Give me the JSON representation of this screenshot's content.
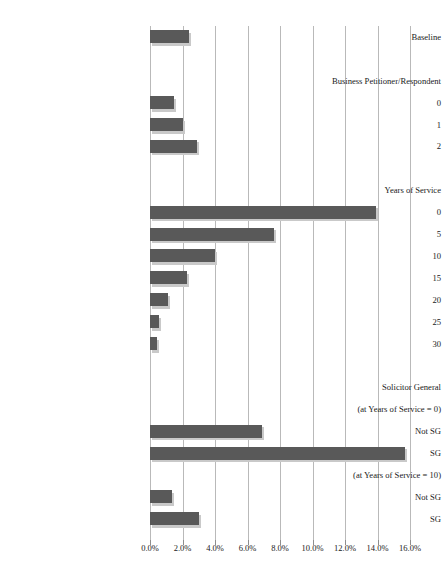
{
  "chart_data": {
    "type": "bar",
    "orientation": "horizontal",
    "title": "",
    "subtitle": "",
    "xlabel": "",
    "ylabel": "",
    "xlim": [
      0,
      16
    ],
    "xtick_labels": [
      "0.0%",
      "2.0%",
      "4.0%",
      "6.0%",
      "8.0%",
      "10.0%",
      "12.0%",
      "14.0%",
      "16.0%"
    ],
    "xtick_values": [
      0,
      2,
      4,
      6,
      8,
      10,
      12,
      14,
      16
    ],
    "grid": true,
    "legend": "none",
    "bar_color": "#595959",
    "gridline_color": "#b9b9b9",
    "rows": [
      {
        "label": "Baseline",
        "kind": "bar",
        "value": 2.4
      },
      {
        "label": "",
        "kind": "spacer",
        "value": null
      },
      {
        "label": "Business Petitioner/Respondent",
        "kind": "group",
        "value": null
      },
      {
        "label": "0",
        "kind": "bar",
        "value": 1.5
      },
      {
        "label": "1",
        "kind": "bar",
        "value": 2.0
      },
      {
        "label": "2",
        "kind": "bar",
        "value": 2.9
      },
      {
        "label": "",
        "kind": "spacer",
        "value": null
      },
      {
        "label": "Years of Service",
        "kind": "group",
        "value": null
      },
      {
        "label": "0",
        "kind": "bar",
        "value": 13.9
      },
      {
        "label": "5",
        "kind": "bar",
        "value": 7.6
      },
      {
        "label": "10",
        "kind": "bar",
        "value": 4.0
      },
      {
        "label": "15",
        "kind": "bar",
        "value": 2.3
      },
      {
        "label": "20",
        "kind": "bar",
        "value": 1.1
      },
      {
        "label": "25",
        "kind": "bar",
        "value": 0.55
      },
      {
        "label": "30",
        "kind": "bar",
        "value": 0.4
      },
      {
        "label": "",
        "kind": "spacer",
        "value": null
      },
      {
        "label": "Solicitor General",
        "kind": "group",
        "value": null
      },
      {
        "label": "(at Years of Service = 0)",
        "kind": "group",
        "value": null
      },
      {
        "label": "Not SG",
        "kind": "bar",
        "value": 6.9
      },
      {
        "label": "SG",
        "kind": "bar",
        "value": 15.7
      },
      {
        "label": "(at Years of Service = 10)",
        "kind": "group",
        "value": null
      },
      {
        "label": "Not SG",
        "kind": "bar",
        "value": 1.35
      },
      {
        "label": "SG",
        "kind": "bar",
        "value": 3.0
      }
    ]
  }
}
